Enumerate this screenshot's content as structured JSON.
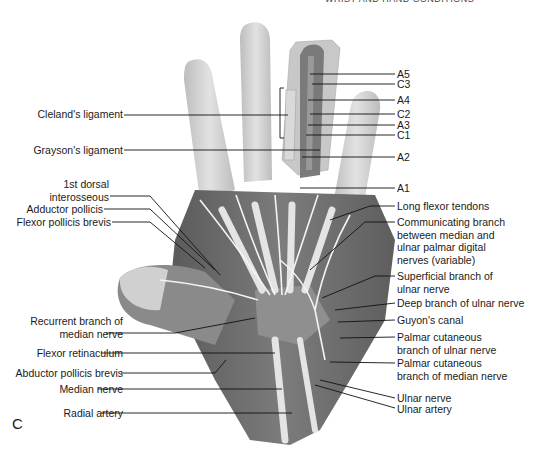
{
  "header": {
    "running_title": "WRIST AND HAND CONDITIONS",
    "page_number": "..."
  },
  "figure": {
    "panel_label": "C",
    "style": "grayscale anatomical illustration, palmar view of right hand",
    "colors": {
      "skin": "#d4d4d4",
      "muscle": "#6e6e6e",
      "tendon": "#e6e6e6",
      "nerve": "#f0f0f0",
      "leader_line": "#111111",
      "text": "#1a1a1a"
    },
    "labels_left": [
      {
        "id": "clelands",
        "text": "Cleland's ligament"
      },
      {
        "id": "graysons",
        "text": "Grayson's ligament"
      },
      {
        "id": "dorsal-interosseous",
        "lines": [
          "1st dorsal",
          "interosseous"
        ]
      },
      {
        "id": "adductor-pollicis",
        "text": "Adductor pollicis"
      },
      {
        "id": "fpb",
        "text": "Flexor pollicis brevis"
      },
      {
        "id": "recurrent-branch",
        "lines": [
          "Recurrent branch of",
          "median nerve"
        ]
      },
      {
        "id": "flexor-retinaculum",
        "text": "Flexor retinaculum"
      },
      {
        "id": "apb",
        "text": "Abductor pollicis brevis"
      },
      {
        "id": "median-nerve",
        "text": "Median nerve"
      },
      {
        "id": "radial-artery",
        "text": "Radial artery"
      }
    ],
    "labels_right": [
      {
        "id": "a5",
        "text": "A5"
      },
      {
        "id": "c3",
        "text": "C3"
      },
      {
        "id": "a4",
        "text": "A4"
      },
      {
        "id": "c2",
        "text": "C2"
      },
      {
        "id": "a3",
        "text": "A3"
      },
      {
        "id": "c1",
        "text": "C1"
      },
      {
        "id": "a2",
        "text": "A2"
      },
      {
        "id": "a1",
        "text": "A1"
      },
      {
        "id": "long-flexor",
        "text": "Long flexor tendons"
      },
      {
        "id": "communicating",
        "lines": [
          "Communicating branch",
          "between median and",
          "ulnar palmar digital",
          "nerves (variable)"
        ]
      },
      {
        "id": "superficial-ulnar",
        "lines": [
          "Superficial branch of",
          "ulnar nerve"
        ]
      },
      {
        "id": "deep-ulnar",
        "text": "Deep branch of ulnar nerve"
      },
      {
        "id": "guyon",
        "text": "Guyon's canal"
      },
      {
        "id": "palmar-cut-ulnar",
        "lines": [
          "Palmar cutaneous",
          "branch of ulnar nerve"
        ]
      },
      {
        "id": "palmar-cut-median",
        "lines": [
          "Palmar cutaneous",
          "branch of median nerve"
        ]
      },
      {
        "id": "ulnar-nerve",
        "text": "Ulnar nerve"
      },
      {
        "id": "ulnar-artery",
        "text": "Ulnar artery"
      }
    ]
  }
}
